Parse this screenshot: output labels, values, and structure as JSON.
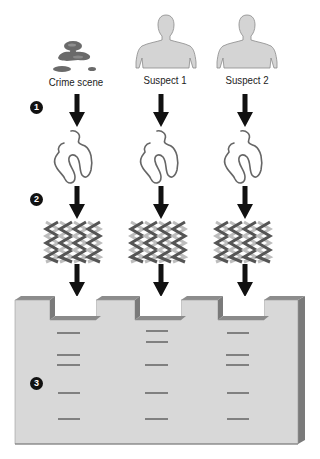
{
  "diagram": {
    "sources": [
      {
        "label": "Crime scene",
        "icon": "blood-stain-icon",
        "center_x": 75
      },
      {
        "label": "Suspect 1",
        "icon": "person-silhouette-icon",
        "center_x": 163
      },
      {
        "label": "Suspect 2",
        "icon": "person-silhouette-icon",
        "center_x": 246
      }
    ],
    "steps": [
      {
        "number": "1",
        "description": "Extract DNA"
      },
      {
        "number": "2",
        "description": "Cut DNA into fragments"
      },
      {
        "number": "3",
        "description": "Separate fragments by gel electrophoresis"
      }
    ],
    "gel": {
      "lanes": [
        {
          "source": "Crime scene",
          "band_y": [
            333,
            355,
            365,
            393,
            419
          ]
        },
        {
          "source": "Suspect 1",
          "band_y": [
            331,
            342,
            365,
            393,
            419
          ]
        },
        {
          "source": "Suspect 2",
          "band_y": [
            333,
            355,
            365,
            393,
            419
          ]
        }
      ],
      "colors": {
        "face": "#d8d8d8",
        "side": "#7a7a7a",
        "top": "#8c8c8c",
        "band": "#6a6a6a"
      }
    }
  }
}
